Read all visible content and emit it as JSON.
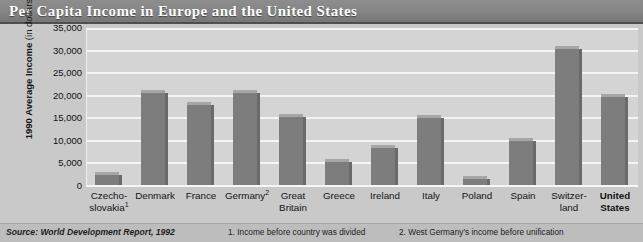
{
  "title": "Per Capita Income in Europe and the United States",
  "yaxis_title_bold": "1990 Average Income",
  "yaxis_title_light": " (in dollars)",
  "footer": {
    "source": "Source: World Development Report, 1992",
    "note1": "1. Income before country was divided",
    "note2": "2. West Germany's income before unification"
  },
  "colors": {
    "title_band": "#848484",
    "title_text": "#ffffff",
    "figure_background": "#c9c9c9",
    "plot_background": "#d4d4d4",
    "gridline": "#f4f4f4",
    "bar_face": "#7d7d7d",
    "bar_top": "#a6a6a6",
    "bar_side": "#6a6a6a",
    "footer_background": "#bdbdbd"
  },
  "chart_data": {
    "type": "bar",
    "title": "Per Capita Income in Europe and the United States",
    "xlabel": "",
    "ylabel": "1990 Average Income (in dollars)",
    "ylim": [
      0,
      35000
    ],
    "yticks": [
      35000,
      30000,
      25000,
      20000,
      15000,
      10000,
      5000,
      0
    ],
    "ytick_labels": [
      "35,000",
      "30,000",
      "25,000",
      "20,000",
      "15,000",
      "10,000",
      "5,000",
      "0"
    ],
    "grid": true,
    "legend": "none",
    "categories": [
      "Czecho-\nslovakia¹",
      "Denmark",
      "France",
      "Germany²",
      "Great\nBritain",
      "Greece",
      "Ireland",
      "Italy",
      "Poland",
      "Spain",
      "Switzer-\nland",
      "United\nStates"
    ],
    "category_plain": [
      "Czechoslovakia",
      "Denmark",
      "France",
      "Germany",
      "Great Britain",
      "Greece",
      "Ireland",
      "Italy",
      "Poland",
      "Spain",
      "Switzerland",
      "United States"
    ],
    "values": [
      2500,
      20500,
      18000,
      20700,
      15200,
      5400,
      8500,
      15100,
      1600,
      10000,
      30300,
      19800
    ],
    "annotations": [
      "1. Income before country was divided",
      "2. West Germany's income before unification"
    ],
    "source": "Source: World Development Report, 1992"
  }
}
